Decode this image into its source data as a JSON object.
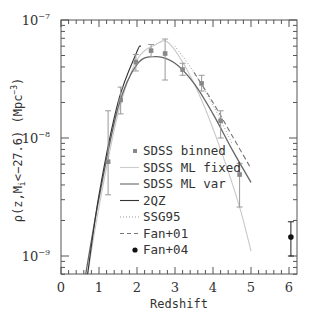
{
  "chart_data": {
    "type": "line",
    "title": "",
    "xlabel": "Redshift",
    "ylabel": "ρ(z,M_i<−27.6) (Mpc^−3)",
    "xlim": [
      0,
      6.3
    ],
    "ylim": [
      7e-10,
      1e-07
    ],
    "yscale": "log",
    "grid": false,
    "legend_position": "lower center inside",
    "x_ticks": [
      "0",
      "1",
      "2",
      "3",
      "4",
      "5",
      "6"
    ],
    "y_ticks": [
      {
        "base": "10",
        "exp": "-7",
        "value": 1e-07
      },
      {
        "base": "10",
        "exp": "-8",
        "value": 1e-08
      },
      {
        "base": "10",
        "exp": "-9",
        "value": 1e-09
      }
    ],
    "series": [
      {
        "name": "SDSS binned",
        "style": "gray square markers with error bars",
        "x": [
          1.24,
          1.57,
          1.97,
          2.37,
          2.74,
          3.2,
          3.7,
          4.2,
          4.7
        ],
        "y": [
          6.3e-09,
          2.1e-08,
          4.4e-08,
          5.5e-08,
          5.2e-08,
          3.8e-08,
          2.9e-08,
          1.4e-08,
          4.9e-09
        ],
        "y_err_low": [
          3.3e-09,
          1.6e-08,
          3.7e-08,
          4.9e-08,
          3.1e-08,
          3.4e-08,
          2.5e-08,
          1e-08,
          2.6e-09
        ],
        "y_err_high": [
          1.7e-08,
          2.7e-08,
          5.1e-08,
          6.2e-08,
          6.9e-08,
          4.3e-08,
          3.4e-08,
          1.7e-08,
          6.1e-09
        ]
      },
      {
        "name": "SDSS ML fixed",
        "style": "light gray solid",
        "x": [
          0.7,
          1.0,
          1.5,
          2.0,
          2.5,
          2.8,
          3.2,
          3.7,
          4.2,
          4.7,
          5.0
        ],
        "y": [
          7e-10,
          2.6e-09,
          1.6e-08,
          4.6e-08,
          6.2e-08,
          6.5e-08,
          4.4e-08,
          2.1e-08,
          8e-09,
          2.6e-09,
          1.1e-09
        ]
      },
      {
        "name": "SDSS ML var",
        "style": "dark gray solid",
        "x": [
          0.65,
          1.0,
          1.5,
          2.0,
          2.5,
          3.0,
          3.5,
          4.0,
          4.5,
          5.0
        ],
        "y": [
          7e-10,
          3.1e-09,
          1.8e-08,
          4.2e-08,
          4.9e-08,
          4.3e-08,
          2.9e-08,
          1.6e-08,
          8e-09,
          4.2e-09
        ]
      },
      {
        "name": "2QZ",
        "style": "black solid",
        "x": [
          0.7,
          1.0,
          1.5,
          2.0,
          2.1
        ],
        "y": [
          7e-10,
          3.3e-09,
          2e-08,
          5.4e-08,
          6e-08
        ]
      },
      {
        "name": "SSG95",
        "style": "dotted",
        "x": [
          3.0,
          3.5,
          4.0,
          4.5
        ],
        "y": [
          6e-08,
          3.6e-08,
          1.9e-08,
          9e-09
        ]
      },
      {
        "name": "Fan+01",
        "style": "dashed",
        "x": [
          3.5,
          4.0,
          4.5,
          5.0
        ],
        "y": [
          3.6e-08,
          2e-08,
          1.05e-08,
          5.5e-09
        ]
      },
      {
        "name": "Fan+04",
        "style": "black filled circle with error bar",
        "x": [
          6.05
        ],
        "y": [
          1.45e-09
        ],
        "y_err_low": [
          1e-09
        ],
        "y_err_high": [
          1.95e-09
        ]
      }
    ]
  },
  "legend": [
    {
      "label": "SDSS binned",
      "marker": "square"
    },
    {
      "label": "SDSS ML fixed",
      "marker": "line-light"
    },
    {
      "label": "SDSS ML var",
      "marker": "line-mid"
    },
    {
      "label": "2QZ",
      "marker": "line-dark"
    },
    {
      "label": "SSG95",
      "marker": "dotted"
    },
    {
      "label": "Fan+01",
      "marker": "dashed"
    },
    {
      "label": "Fan+04",
      "marker": "circle"
    }
  ],
  "axes": {
    "xlabel": "Redshift",
    "ylabel_main": "ρ(z,M",
    "ylabel_sub": "i",
    "ylabel_rest": "<−27.6) (Mpc",
    "ylabel_exp": "−3",
    "ylabel_close": ")"
  }
}
